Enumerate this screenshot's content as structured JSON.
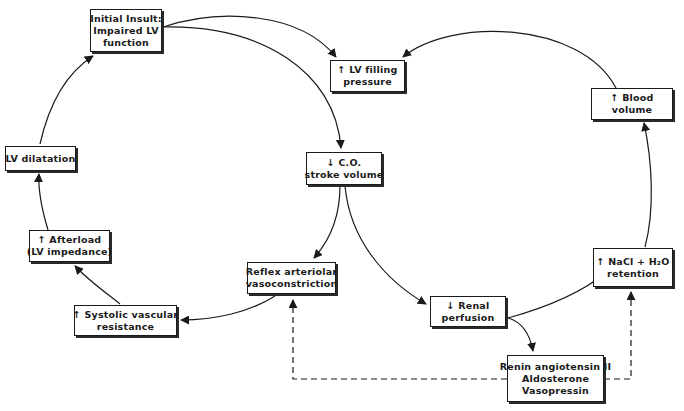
{
  "diagram": {
    "type": "flowchart",
    "colors": {
      "line": "#1a1a1a",
      "box_border": "#1a1a1a",
      "background": "#ffffff"
    },
    "nodes": {
      "initial_insult": {
        "lines": [
          "Initial Insult:",
          "Impaired LV",
          "function"
        ]
      },
      "lv_filling": {
        "lines": [
          "↑ LV filling",
          "pressure"
        ]
      },
      "blood_volume": {
        "lines": [
          "↑ Blood",
          "volume"
        ]
      },
      "co_stroke": {
        "lines": [
          "↓ C.O.",
          "stroke volume"
        ]
      },
      "lv_dilatation": {
        "lines": [
          "LV dilatation"
        ]
      },
      "afterload": {
        "lines": [
          "↑ Afterload",
          "(LV impedance)"
        ]
      },
      "reflex": {
        "lines": [
          "Reflex arteriolar",
          "vasoconstriction"
        ]
      },
      "systolic": {
        "lines": [
          "↑ Systolic vascular",
          "resistance"
        ]
      },
      "renal": {
        "lines": [
          "↓ Renal",
          "perfusion"
        ]
      },
      "nacl": {
        "lines": [
          "↑ NaCl + H₂O",
          "retention"
        ]
      },
      "renin": {
        "lines": [
          "Renin angiotensin II",
          "Aldosterone",
          "Vasopressin"
        ]
      }
    },
    "edges": [
      {
        "from": "initial_insult",
        "to": "lv_filling",
        "style": "solid"
      },
      {
        "from": "initial_insult",
        "to": "co_stroke",
        "style": "solid"
      },
      {
        "from": "blood_volume",
        "to": "lv_filling",
        "style": "solid"
      },
      {
        "from": "co_stroke",
        "to": "reflex",
        "style": "solid"
      },
      {
        "from": "co_stroke",
        "to": "renal",
        "style": "solid"
      },
      {
        "from": "reflex",
        "to": "systolic",
        "style": "solid"
      },
      {
        "from": "systolic",
        "to": "afterload",
        "style": "solid"
      },
      {
        "from": "afterload",
        "to": "lv_dilatation",
        "style": "solid"
      },
      {
        "from": "lv_dilatation",
        "to": "initial_insult",
        "style": "solid"
      },
      {
        "from": "renal",
        "to": "renin",
        "style": "solid"
      },
      {
        "from": "renal",
        "to": "nacl",
        "style": "solid"
      },
      {
        "from": "nacl",
        "to": "blood_volume",
        "style": "solid"
      },
      {
        "from": "renin",
        "to": "reflex",
        "style": "dashed"
      },
      {
        "from": "renin",
        "to": "nacl",
        "style": "dashed"
      }
    ]
  }
}
